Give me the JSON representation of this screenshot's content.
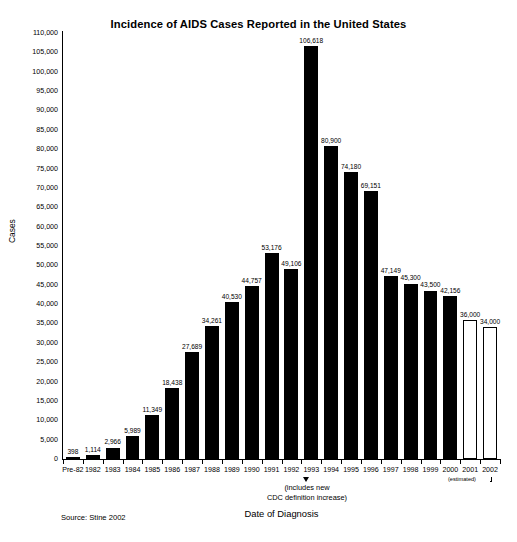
{
  "chart_data": {
    "type": "bar",
    "title": "Incidence of AIDS Cases Reported in the United States",
    "xlabel": "Date of Diagnosis",
    "ylabel": "Cases",
    "ylim": [
      0,
      110000
    ],
    "ytick_step": 5000,
    "grid": false,
    "legend": null,
    "categories": [
      "Pre-82",
      "1982",
      "1983",
      "1984",
      "1985",
      "1986",
      "1987",
      "1988",
      "1989",
      "1990",
      "1991",
      "1992",
      "1993",
      "1994",
      "1995",
      "1996",
      "1997",
      "1998",
      "1999",
      "2000",
      "2001",
      "2002"
    ],
    "values": [
      398,
      1114,
      2966,
      5989,
      11349,
      18438,
      27689,
      34261,
      40530,
      44757,
      53176,
      49106,
      106618,
      80900,
      74180,
      69151,
      47149,
      45300,
      43500,
      42156,
      36000,
      34000
    ],
    "value_labels": [
      "398",
      "1,114",
      "2,966",
      "5,989",
      "11,349",
      "18,438",
      "27,689",
      "34,261",
      "40,530",
      "44,757",
      "53,176",
      "49,106",
      "106,618",
      "80,900",
      "74,180",
      "69,151",
      "47,149",
      "45,300",
      "43,500",
      "42,156",
      "36,000",
      "34,000"
    ],
    "estimated_flags": [
      false,
      false,
      false,
      false,
      false,
      false,
      false,
      false,
      false,
      false,
      false,
      false,
      false,
      false,
      false,
      false,
      false,
      false,
      false,
      false,
      true,
      true
    ],
    "ytick_labels": [
      "110,000",
      "105,000",
      "100,000",
      "95,000",
      "90,000",
      "85,000",
      "80,000",
      "75,000",
      "70,000",
      "65,000",
      "60,000",
      "55,000",
      "50,000",
      "45,000",
      "40,000",
      "35,000",
      "30,000",
      "25,000",
      "20,000",
      "15,000",
      "10,000",
      "5,000",
      "0"
    ],
    "ytick_values": [
      110000,
      105000,
      100000,
      95000,
      90000,
      85000,
      80000,
      75000,
      70000,
      65000,
      60000,
      55000,
      50000,
      45000,
      40000,
      35000,
      30000,
      25000,
      20000,
      15000,
      10000,
      5000,
      0
    ],
    "annotations": [
      {
        "name": "cdc-definition-note",
        "target_category": "1993",
        "text": "(includes new\nCDC definition increase)"
      },
      {
        "name": "estimated-bracket",
        "covers": [
          "2001",
          "2002"
        ],
        "text": "(estimated)"
      }
    ],
    "colors": {
      "bar_fill": "#000000",
      "bar_estimated_fill": "#ffffff",
      "bar_estimated_stroke": "#000000",
      "axis": "#000000",
      "background": "#ffffff",
      "text": "#000000"
    }
  },
  "notes": {
    "cdc_line1": "(includes new",
    "cdc_line2": "CDC definition increase)",
    "source": "Source: Stine 2002",
    "estimated": "(estimated)"
  }
}
